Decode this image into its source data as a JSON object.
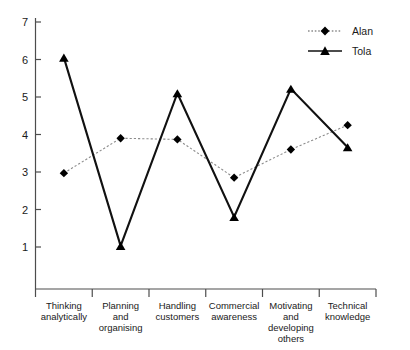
{
  "chart_data": {
    "type": "line",
    "title": "",
    "xlabel": "",
    "ylabel": "",
    "ylim": [
      0,
      7
    ],
    "yticks": [
      1,
      2,
      3,
      4,
      5,
      6,
      7
    ],
    "ytick_labels": [
      "1",
      "2",
      "3",
      "4",
      "5",
      "6",
      "7"
    ],
    "grid": false,
    "legend_position": "top-right",
    "categories": [
      "Thinking analytically",
      "Planning and organising",
      "Handling customers",
      "Commercial awareness",
      "Motivating and developing others",
      "Technical knowledge"
    ],
    "category_lines": [
      [
        "Thinking",
        "analytically"
      ],
      [
        "Planning",
        "and",
        "organising"
      ],
      [
        "Handling",
        "customers"
      ],
      [
        "Commercial",
        "awareness"
      ],
      [
        "Motivating",
        "and",
        "developing",
        "others"
      ],
      [
        "Technical",
        "knowledge"
      ]
    ],
    "series": [
      {
        "name": "Alan",
        "marker": "diamond",
        "linestyle": "dotted",
        "color": "#8c8c8c",
        "marker_color": "#000000",
        "values": [
          2.97,
          3.9,
          3.87,
          2.85,
          3.6,
          4.25
        ]
      },
      {
        "name": "Tola",
        "marker": "triangle",
        "linestyle": "solid",
        "color": "#111111",
        "marker_color": "#000000",
        "values": [
          6.05,
          1.03,
          5.1,
          1.8,
          5.22,
          3.66
        ]
      }
    ]
  },
  "legend": {
    "entries": [
      {
        "label": "Alan"
      },
      {
        "label": "Tola"
      }
    ]
  },
  "axis": {
    "y_tick_labels": [
      "7",
      "6",
      "5",
      "4",
      "3",
      "2",
      "1"
    ]
  }
}
